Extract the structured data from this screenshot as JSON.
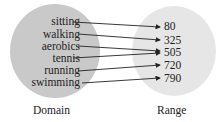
{
  "diagram": {
    "type": "mapping",
    "domain": {
      "caption": "Domain",
      "items": [
        "sitting",
        "walking",
        "aerobics",
        "tennis",
        "running",
        "swimming"
      ]
    },
    "range": {
      "caption": "Range",
      "items": [
        "80",
        "325",
        "505",
        "720",
        "790"
      ]
    },
    "mappings": [
      {
        "from": "sitting",
        "to": "80"
      },
      {
        "from": "walking",
        "to": "325"
      },
      {
        "from": "aerobics",
        "to": "505"
      },
      {
        "from": "tennis",
        "to": "505"
      },
      {
        "from": "running",
        "to": "720"
      },
      {
        "from": "swimming",
        "to": "790"
      }
    ],
    "colors": {
      "domain_fill": "#c9c9c9",
      "range_fill": "#e6e6e6",
      "arrow": "#222222"
    }
  }
}
